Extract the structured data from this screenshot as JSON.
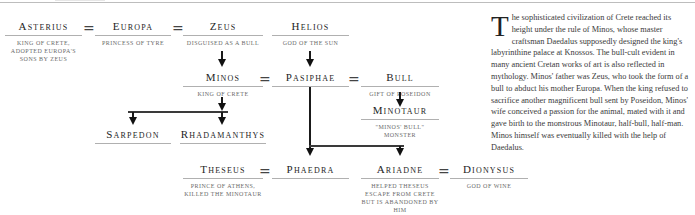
{
  "header": {
    "title_visible": false
  },
  "family_tree": {
    "nodes": [
      {
        "id": "asterius",
        "name": "Asterius",
        "desc": "King of Crete, adopted Europa's sons by Zeus"
      },
      {
        "id": "europa",
        "name": "Europa",
        "desc": "Princess of Tyre"
      },
      {
        "id": "zeus",
        "name": "Zeus",
        "desc": "Disguised as a bull"
      },
      {
        "id": "helios",
        "name": "Helios",
        "desc": "God of the sun"
      },
      {
        "id": "minos",
        "name": "Minos",
        "desc": "King of Crete"
      },
      {
        "id": "pasiphae",
        "name": "Pasiphae",
        "desc": ""
      },
      {
        "id": "bull",
        "name": "Bull",
        "desc": "Gift of Poseidon"
      },
      {
        "id": "minotaur",
        "name": "Minotaur",
        "desc": "\"Minos' bull\" monster"
      },
      {
        "id": "sarpedon",
        "name": "Sarpedon",
        "desc": ""
      },
      {
        "id": "rhadamanthys",
        "name": "Rhadamanthys",
        "desc": ""
      },
      {
        "id": "theseus",
        "name": "Theseus",
        "desc": "Prince of Athens, killed the Minotaur"
      },
      {
        "id": "phaedra",
        "name": "Phaedra",
        "desc": ""
      },
      {
        "id": "ariadne",
        "name": "Ariadne",
        "desc": "Helped Theseus escape from Crete but is abandoned by him"
      },
      {
        "id": "dionysus",
        "name": "Dionysus",
        "desc": "God of wine"
      }
    ],
    "marriage_symbol": "="
  },
  "article": {
    "dropcap": "T",
    "body": "he sophisticated civilization of Crete reached its height under the rule of Minos, whose master craftsman Daedalus supposedly designed the king's labyrinthine palace at Knossos. The bull-cult evident in many ancient Cretan works of art is also reflected in mythology. Minos' father was Zeus, who took the form of a bull to abduct his mother Europa. When the king refused to sacrifice another magnificent bull sent by Poseidon, Minos' wife conceived a passion for the animal, mated with it and gave birth to the monstrous Minotaur, half-bull, half-man. Minos himself was eventually killed with the help of Daedalus."
  }
}
